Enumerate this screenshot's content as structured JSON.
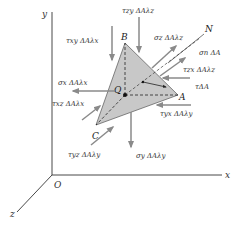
{
  "axes": {
    "y_label": "y",
    "x_label": "x",
    "z_label": "z",
    "origin_label": "O"
  },
  "points": {
    "A": "A",
    "B": "B",
    "C": "C",
    "Q": "Q",
    "N": "N"
  },
  "forces": {
    "tau_zy": "τzy ΔAλz",
    "tau_xy": "τxy ΔAλx",
    "sigma_z": "σz ΔAλz",
    "sigma_n": "σn ΔA",
    "sigma_x": "σx ΔAλx",
    "tau_zx": "τzx ΔAλz",
    "tau_xz": "τxz ΔAλx",
    "tau": "τΔA",
    "tau_yx": "τyx ΔAλy",
    "tau_yz": "τyz ΔAλy",
    "sigma_y": "σy ΔAλy"
  },
  "colors": {
    "face_fill": "#c8c8c8",
    "arrow": "#8a8a8a",
    "axis": "#333333",
    "line": "#222222"
  }
}
